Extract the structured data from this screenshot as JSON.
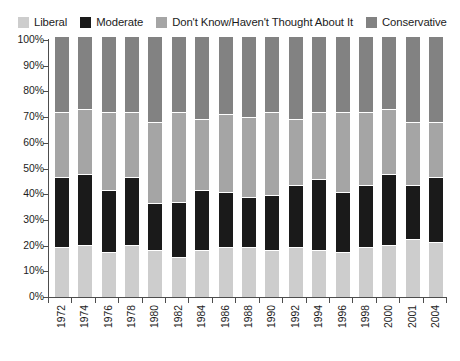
{
  "legend": {
    "items": [
      {
        "label": "Liberal",
        "color": "#cdcdcd",
        "swatch_name": "legend-swatch-liberal"
      },
      {
        "label": "Moderate",
        "color": "#1a1a1a",
        "swatch_name": "legend-swatch-moderate"
      },
      {
        "label": "Don't Know/Haven't Thought About It",
        "color": "#a5a5a5",
        "swatch_name": "legend-swatch-dont-know"
      },
      {
        "label": "Conservative",
        "color": "#828282",
        "swatch_name": "legend-swatch-conservative"
      }
    ]
  },
  "axis": {
    "y_ticks": [
      "100%",
      "90%",
      "80%",
      "70%",
      "60%",
      "50%",
      "40%",
      "30%",
      "20%",
      "10%",
      "0%"
    ],
    "y_min": 0,
    "y_max": 100
  },
  "chart_data": {
    "type": "bar",
    "stacked": true,
    "stack_total": 100,
    "title": "",
    "subtitle": "",
    "xlabel": "",
    "ylabel": "",
    "ylim": [
      0,
      100
    ],
    "grid": false,
    "legend_position": "top",
    "categories": [
      "1972",
      "1974",
      "1976",
      "1978",
      "1980",
      "1982",
      "1984",
      "1986",
      "1988",
      "1990",
      "1992",
      "1994",
      "1996",
      "1998",
      "2000",
      "2001",
      "2004"
    ],
    "series": [
      {
        "name": "Liberal",
        "color": "#cdcdcd",
        "values": [
          19,
          20,
          17,
          20,
          18,
          15,
          18,
          19,
          19,
          18,
          19,
          18,
          17,
          19,
          20,
          22,
          21
        ]
      },
      {
        "name": "Moderate",
        "color": "#1a1a1a",
        "values": [
          27,
          27,
          24,
          26,
          18,
          21,
          23,
          21,
          19,
          21,
          24,
          27,
          23,
          24,
          27,
          21,
          25
        ]
      },
      {
        "name": "Don't Know/Haven't Thought About It",
        "color": "#a5a5a5",
        "values": [
          25,
          25,
          30,
          25,
          31,
          35,
          27,
          30,
          31,
          32,
          25,
          26,
          31,
          28,
          25,
          24,
          21
        ]
      },
      {
        "name": "Conservative",
        "color": "#828282",
        "values": [
          29,
          28,
          29,
          29,
          33,
          29,
          32,
          30,
          31,
          29,
          32,
          29,
          29,
          29,
          28,
          33,
          33
        ]
      }
    ]
  }
}
